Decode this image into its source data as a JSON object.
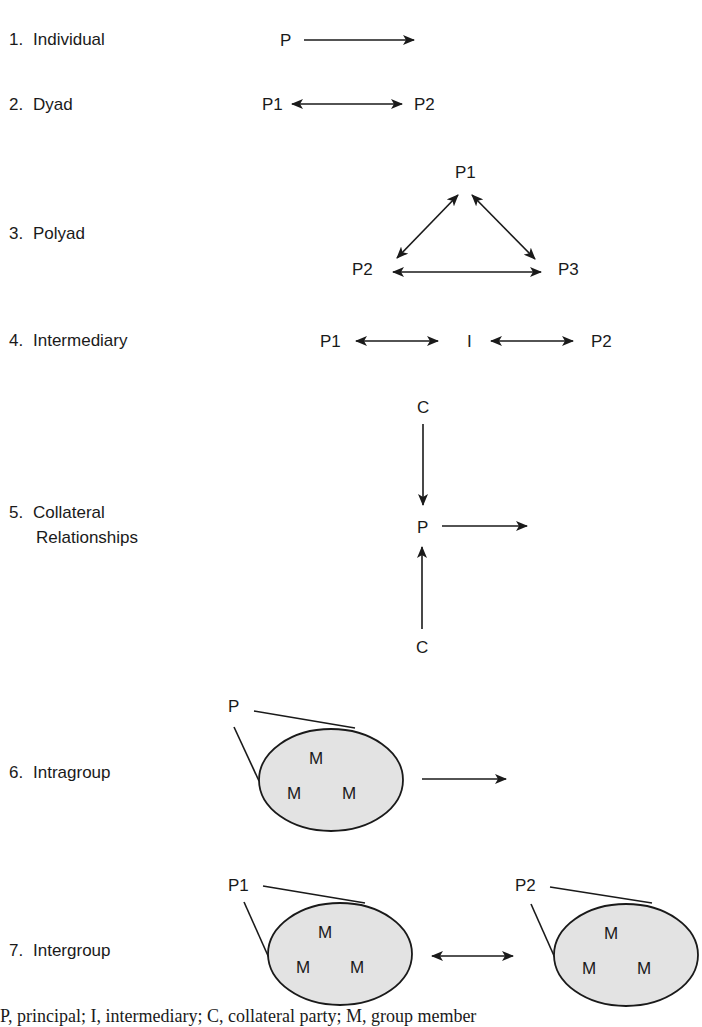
{
  "rows": [
    {
      "num": "1.",
      "label": "Individual"
    },
    {
      "num": "2.",
      "label": "Dyad"
    },
    {
      "num": "3.",
      "label": "Polyad"
    },
    {
      "num": "4.",
      "label": "Intermediary"
    },
    {
      "num": "5.",
      "label": "Collateral",
      "label2": "Relationships"
    },
    {
      "num": "6.",
      "label": "Intragroup"
    },
    {
      "num": "7.",
      "label": "Intergroup"
    }
  ],
  "nodes": {
    "individual": {
      "p": "P"
    },
    "dyad": {
      "p1": "P1",
      "p2": "P2"
    },
    "polyad": {
      "p1": "P1",
      "p2": "P2",
      "p3": "P3"
    },
    "intermediary": {
      "p1": "P1",
      "i": "I",
      "p2": "P2"
    },
    "collateral": {
      "c_top": "C",
      "p": "P",
      "c_bottom": "C"
    },
    "intragroup": {
      "p": "P",
      "members": [
        "M",
        "M",
        "M"
      ]
    },
    "intergroup": {
      "p1": "P1",
      "p2": "P2",
      "members_left": [
        "M",
        "M",
        "M"
      ],
      "members_right": [
        "M",
        "M",
        "M"
      ]
    }
  },
  "colors": {
    "ink": "#1a1a1a",
    "group_fill": "#e3e3e3"
  },
  "caption": "P, principal; I, intermediary; C, collateral party; M, group member"
}
